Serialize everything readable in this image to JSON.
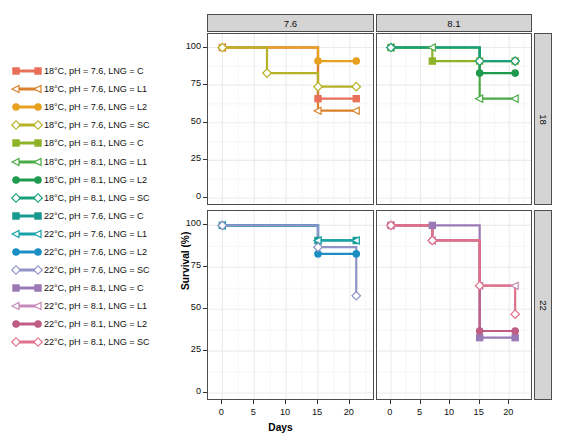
{
  "figure": {
    "xlabel": "Days",
    "ylabel": "Survival (%)",
    "col_strips": [
      "7.6",
      "8.1"
    ],
    "row_strips": [
      "18",
      "22"
    ],
    "ylim": [
      0,
      105
    ],
    "xlim": [
      -1,
      23
    ],
    "yticks": [
      "0",
      "25",
      "50",
      "75",
      "100"
    ],
    "ytick_values": [
      0,
      25,
      50,
      75,
      100
    ],
    "xticks": [
      "0",
      "5",
      "10",
      "15",
      "20"
    ],
    "xtick_values": [
      0,
      5,
      10,
      15,
      20
    ],
    "grid": true,
    "legend_position": "left"
  },
  "legend": {
    "items": [
      {
        "label": "18°C, pH = 7.6, LNG = C",
        "color": "#e8705a",
        "marker": "square"
      },
      {
        "label": "18°C, pH = 7.6, LNG = L1",
        "color": "#d9822b",
        "marker": "tri"
      },
      {
        "label": "18°C, pH = 7.6, LNG = L2",
        "color": "#e8a020",
        "marker": "circle"
      },
      {
        "label": "18°C, pH = 7.6, LNG = SC",
        "color": "#b5b226",
        "marker": "diamond"
      },
      {
        "label": "18°C, pH = 8.1, LNG = C",
        "color": "#8fb327",
        "marker": "square"
      },
      {
        "label": "18°C, pH = 8.1, LNG = L1",
        "color": "#4aab45",
        "marker": "tri"
      },
      {
        "label": "18°C, pH = 8.1, LNG = L2",
        "color": "#1f9a4e",
        "marker": "circle"
      },
      {
        "label": "18°C, pH = 8.1, LNG = SC",
        "color": "#18a07a",
        "marker": "diamond"
      },
      {
        "label": "22°C, pH = 7.6, LNG = C",
        "color": "#17998f",
        "marker": "square"
      },
      {
        "label": "22°C, pH = 7.6, LNG = L1",
        "color": "#18a2a8",
        "marker": "tri"
      },
      {
        "label": "22°C, pH = 7.6, LNG = L2",
        "color": "#1b8fc4",
        "marker": "circle"
      },
      {
        "label": "22°C, pH = 7.6, LNG = SC",
        "color": "#8f93c6",
        "marker": "diamond"
      },
      {
        "label": "22°C, pH = 8.1, LNG = C",
        "color": "#9a79b5",
        "marker": "square"
      },
      {
        "label": "22°C, pH = 8.1, LNG = L1",
        "color": "#c48bb8",
        "marker": "tri"
      },
      {
        "label": "22°C, pH = 8.1, LNG = L2",
        "color": "#bf5d84",
        "marker": "circle"
      },
      {
        "label": "22°C, pH = 8.1, LNG = SC",
        "color": "#e1718a",
        "marker": "diamond"
      }
    ]
  },
  "chart_data": {
    "type": "line",
    "title": "",
    "xlabel": "Days",
    "ylabel": "Survival (%)",
    "xlim": [
      -1,
      23
    ],
    "ylim": [
      0,
      105
    ],
    "grid": true,
    "facet_cols": [
      "7.6",
      "8.1"
    ],
    "facet_rows": [
      "18",
      "22"
    ],
    "facet_col_variable": "pH",
    "facet_row_variable": "Temperature (°C)",
    "panels": [
      {
        "row": "18",
        "col": "7.6",
        "series": [
          {
            "name": "18°C, pH = 7.6, LNG = C",
            "color": "#e8705a",
            "marker": "square",
            "x": [
              0,
              15,
              21
            ],
            "y": [
              100,
              66,
              66
            ]
          },
          {
            "name": "18°C, pH = 7.6, LNG = L1",
            "color": "#d9822b",
            "marker": "tri",
            "x": [
              0,
              15,
              21
            ],
            "y": [
              100,
              58,
              58
            ]
          },
          {
            "name": "18°C, pH = 7.6, LNG = L2",
            "color": "#e8a020",
            "marker": "circle",
            "x": [
              0,
              15,
              21
            ],
            "y": [
              100,
              91,
              91
            ]
          },
          {
            "name": "18°C, pH = 7.6, LNG = SC",
            "color": "#b5b226",
            "marker": "diamond",
            "x": [
              0,
              7,
              15,
              21
            ],
            "y": [
              100,
              83,
              74,
              74
            ]
          }
        ]
      },
      {
        "row": "18",
        "col": "8.1",
        "series": [
          {
            "name": "18°C, pH = 8.1, LNG = C",
            "color": "#8fb327",
            "marker": "square",
            "x": [
              0,
              7,
              15,
              21
            ],
            "y": [
              100,
              91,
              91,
              91
            ]
          },
          {
            "name": "18°C, pH = 8.1, LNG = L1",
            "color": "#4aab45",
            "marker": "tri",
            "x": [
              0,
              7,
              15,
              21
            ],
            "y": [
              100,
              100,
              66,
              66
            ]
          },
          {
            "name": "18°C, pH = 8.1, LNG = L2",
            "color": "#1f9a4e",
            "marker": "circle",
            "x": [
              0,
              15,
              21
            ],
            "y": [
              100,
              83,
              83
            ]
          },
          {
            "name": "18°C, pH = 8.1, LNG = SC",
            "color": "#18a07a",
            "marker": "diamond",
            "x": [
              0,
              15,
              21
            ],
            "y": [
              100,
              91,
              91
            ]
          }
        ]
      },
      {
        "row": "22",
        "col": "7.6",
        "series": [
          {
            "name": "22°C, pH = 7.6, LNG = C",
            "color": "#17998f",
            "marker": "square",
            "x": [
              0,
              15,
              21
            ],
            "y": [
              100,
              91,
              91
            ]
          },
          {
            "name": "22°C, pH = 7.6, LNG = L1",
            "color": "#18a2a8",
            "marker": "tri",
            "x": [
              0,
              15,
              21
            ],
            "y": [
              100,
              91,
              91
            ]
          },
          {
            "name": "22°C, pH = 7.6, LNG = L2",
            "color": "#1b8fc4",
            "marker": "circle",
            "x": [
              0,
              15,
              21
            ],
            "y": [
              100,
              83,
              83
            ]
          },
          {
            "name": "22°C, pH = 7.6, LNG = SC",
            "color": "#8f93c6",
            "marker": "diamond",
            "x": [
              0,
              15,
              21
            ],
            "y": [
              100,
              87,
              58
            ]
          }
        ]
      },
      {
        "row": "22",
        "col": "8.1",
        "series": [
          {
            "name": "22°C, pH = 8.1, LNG = C",
            "color": "#9a79b5",
            "marker": "square",
            "x": [
              0,
              7,
              15,
              21
            ],
            "y": [
              100,
              100,
              33,
              33
            ]
          },
          {
            "name": "22°C, pH = 8.1, LNG = L1",
            "color": "#c48bb8",
            "marker": "tri",
            "x": [
              0,
              7,
              15,
              21
            ],
            "y": [
              100,
              91,
              64,
              64
            ]
          },
          {
            "name": "22°C, pH = 8.1, LNG = L2",
            "color": "#bf5d84",
            "marker": "circle",
            "x": [
              0,
              7,
              15,
              21
            ],
            "y": [
              100,
              91,
              37,
              37
            ]
          },
          {
            "name": "22°C, pH = 8.1, LNG = SC",
            "color": "#e1718a",
            "marker": "diamond",
            "x": [
              0,
              7,
              15,
              21
            ],
            "y": [
              100,
              91,
              64,
              47
            ]
          }
        ]
      }
    ]
  }
}
